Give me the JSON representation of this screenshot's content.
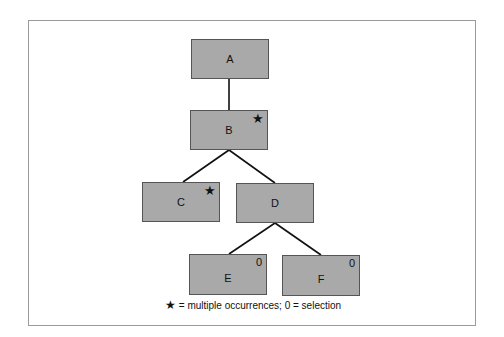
{
  "diagram": {
    "nodes": [
      {
        "id": "A",
        "label": "A",
        "mark": ""
      },
      {
        "id": "B",
        "label": "B",
        "mark": "★"
      },
      {
        "id": "C",
        "label": "C",
        "mark": "★"
      },
      {
        "id": "D",
        "label": "D",
        "mark": ""
      },
      {
        "id": "E",
        "label": "E",
        "mark": "0"
      },
      {
        "id": "F",
        "label": "F",
        "mark": "0"
      }
    ],
    "edges": [
      [
        "A",
        "B"
      ],
      [
        "B",
        "C"
      ],
      [
        "B",
        "D"
      ],
      [
        "D",
        "E"
      ],
      [
        "D",
        "F"
      ]
    ],
    "legend": {
      "star_symbol": "★",
      "text": " = multiple occurrences; 0 = selection"
    }
  }
}
